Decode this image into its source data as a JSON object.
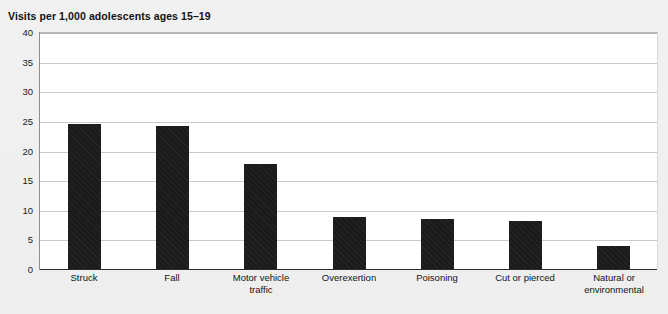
{
  "chart_data": {
    "type": "bar",
    "title": "Visits per 1,000 adolescents ages 15–19",
    "xlabel": "",
    "ylabel": "",
    "ylim": [
      0,
      40
    ],
    "yticks": [
      0,
      5,
      10,
      15,
      20,
      25,
      30,
      35,
      40
    ],
    "ytick_labels": [
      "0",
      "5",
      "10",
      "15",
      "20",
      "25",
      "30",
      "35",
      "40"
    ],
    "grid": true,
    "legend": false,
    "legend_position": "none",
    "bar_color": "#1b1b1b",
    "bar_pattern": "diagonal-hatch",
    "plot_background": "#ffffff",
    "figure_background": "#efefef",
    "categories": [
      "Struck",
      "Fall",
      "Motor vehicle\ntraffic",
      "Overexertion",
      "Poisoning",
      "Cut or pierced",
      "Natural or\nenvironmental"
    ],
    "values": [
      24.5,
      24.2,
      17.7,
      8.7,
      8.5,
      8.1,
      3.8
    ]
  }
}
